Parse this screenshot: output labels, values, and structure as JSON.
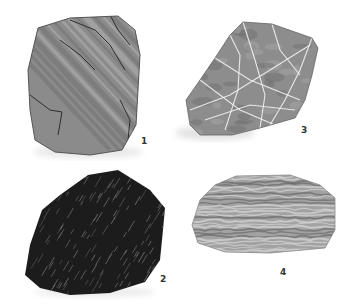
{
  "figure": {
    "specimens": [
      {
        "label": "1",
        "description": "gray rock with diagonal banding and dark cracks",
        "base_color": "#8a8a8a"
      },
      {
        "label": "2",
        "description": "dark, nearly black rock with fine diagonal light streaks",
        "base_color": "#1e1e1e"
      },
      {
        "label": "3",
        "description": "gray rock crossed by white veins",
        "base_color": "#8c8c8c"
      },
      {
        "label": "4",
        "description": "light gray rock with horizontal wavy banding",
        "base_color": "#9a9a9a"
      }
    ]
  }
}
